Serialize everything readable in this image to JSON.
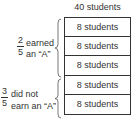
{
  "diagram": {
    "total_label": "40 students",
    "rows": [
      {
        "label": "8 students"
      },
      {
        "label": "8 students"
      },
      {
        "label": "8 students"
      },
      {
        "label": "8 students"
      },
      {
        "label": "8 students"
      }
    ],
    "groups": [
      {
        "numerator": "2",
        "denominator": "5",
        "line1": "earned",
        "line2": "an “A”"
      },
      {
        "numerator": "3",
        "denominator": "5",
        "line1": "did not",
        "line2": "earn an “A”"
      }
    ]
  }
}
